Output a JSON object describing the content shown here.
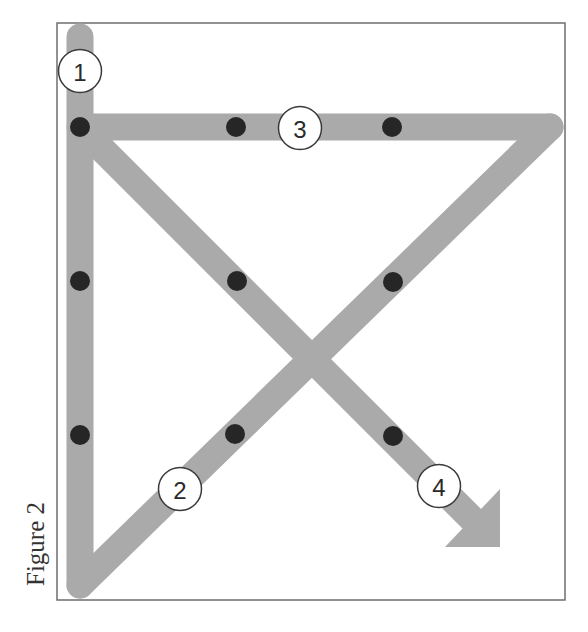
{
  "figure": {
    "caption": "Figure 2",
    "colors": {
      "path": "#aaaaaa",
      "dot": "#262626",
      "frame": "#6e6e6e",
      "label_border": "#3a3a3a"
    },
    "labels": [
      {
        "id": "1",
        "text": "1",
        "cx": 80,
        "cy": 71
      },
      {
        "id": "2",
        "text": "2",
        "cx": 180,
        "cy": 489
      },
      {
        "id": "3",
        "text": "3",
        "cx": 300,
        "cy": 128
      },
      {
        "id": "4",
        "text": "4",
        "cx": 439,
        "cy": 486
      }
    ],
    "dots": [
      {
        "x": 80,
        "y": 127
      },
      {
        "x": 236,
        "y": 127
      },
      {
        "x": 392,
        "y": 127
      },
      {
        "x": 80,
        "y": 281
      },
      {
        "x": 237,
        "y": 281
      },
      {
        "x": 393,
        "y": 282
      },
      {
        "x": 80,
        "y": 435
      },
      {
        "x": 235,
        "y": 434
      },
      {
        "x": 393,
        "y": 436
      }
    ],
    "segments": [
      {
        "step": "1",
        "from": [
          80,
          37
        ],
        "to": [
          80,
          585
        ],
        "direction": "down"
      },
      {
        "step": "2",
        "from": [
          80,
          585
        ],
        "to": [
          550,
          127
        ],
        "direction": "up-right"
      },
      {
        "step": "3",
        "from": [
          550,
          127
        ],
        "to": [
          80,
          127
        ],
        "direction": "left"
      },
      {
        "step": "4",
        "from": [
          80,
          127
        ],
        "to": [
          500,
          547
        ],
        "direction": "down-right",
        "ends_with_arrow": true
      }
    ],
    "grid": {
      "rows": 3,
      "cols": 3,
      "description": "3x3 grid of dots connected by four straight lines"
    }
  }
}
